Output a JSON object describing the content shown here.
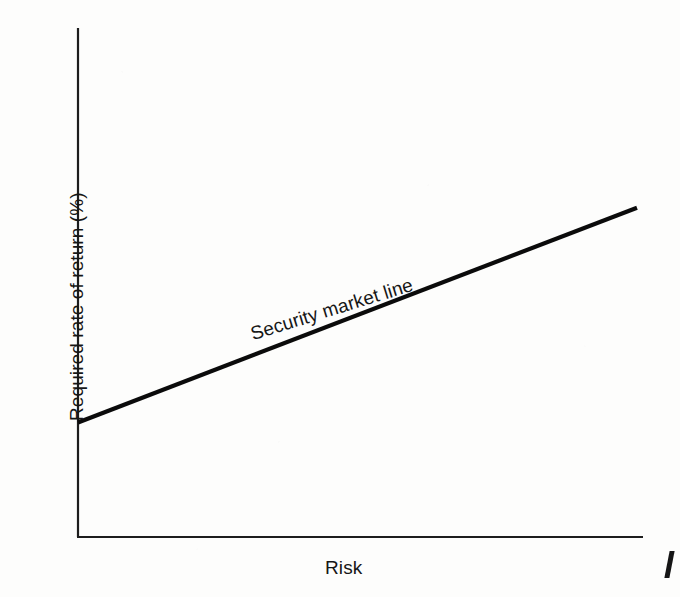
{
  "chart_data": {
    "type": "line",
    "title": "",
    "subtitle": "",
    "xlabel": "Risk",
    "ylabel": "Required rate of return (%)",
    "grid": false,
    "legend_position": "none",
    "xlim": [
      0,
      100
    ],
    "ylim": [
      0,
      100
    ],
    "xticks": [],
    "yticks": [],
    "xticklabels": [],
    "yticklabels": [],
    "series": [
      {
        "name": "Security market line",
        "annotation": "Security market line",
        "annotation_angle_deg": -17.2,
        "x": [
          0,
          100
        ],
        "y": [
          22.5,
          64.7
        ],
        "intercept": 22.5,
        "slope": 0.422,
        "color": "#0b0b0b",
        "stroke_width": 4.2
      }
    ]
  },
  "figure": {
    "background_color": "#fdfdfc",
    "axis_color": "#1d1d1d",
    "text_color": "#161616",
    "edge_mark": ""
  }
}
